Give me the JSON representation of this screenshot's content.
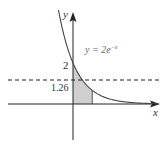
{
  "figure": {
    "function_label": "y = 2e",
    "function_exponent": "−x",
    "x_axis_label": "x",
    "y_axis_label": "y",
    "y_intercept_label": "2",
    "dashed_line_label": "1.26",
    "colors": {
      "curve": "#444444",
      "axes": "#222222",
      "shade": "#cfcfcf",
      "dashed": "#222222",
      "text": "#333333"
    }
  },
  "chart_data": {
    "type": "line",
    "title": "",
    "function": "y = 2e^{-x}",
    "xlabel": "x",
    "ylabel": "y",
    "annotations": [
      {
        "type": "y_intercept",
        "value": 2,
        "label": "2"
      },
      {
        "type": "horizontal_dashed_line",
        "y": 1.26,
        "label": "1.26"
      },
      {
        "type": "shaded_region",
        "under": "y = 2e^{-x}",
        "x_from": 0,
        "x_to": 1.1
      }
    ],
    "grid": false,
    "legend": "none"
  }
}
